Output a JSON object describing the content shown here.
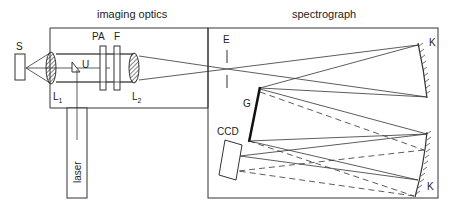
{
  "sections": {
    "imaging_optics": "imaging optics",
    "spectrograph": "spectrograph"
  },
  "components": {
    "source": "S",
    "lens1": "L",
    "lens1_sub": "1",
    "lens2": "L",
    "lens2_sub": "2",
    "prism": "U",
    "polarization_analyzer": "PA",
    "filter": "F",
    "entrance_slit": "E",
    "grating": "G",
    "mirror_top": "K",
    "mirror_bottom": "K",
    "detector": "CCD",
    "laser": "laser"
  },
  "colors": {
    "line": "#333333",
    "background": "#ffffff"
  }
}
